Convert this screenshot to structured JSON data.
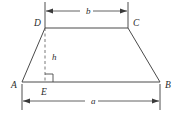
{
  "figure": {
    "name": "trapezoid-with-altitude",
    "colors": {
      "background": "#ffffff",
      "stroke": "#4a4a4a",
      "dimension_stroke": "#3a3a3a",
      "dashed_stroke": "#6a6a6a",
      "label_fill": "#2b2b2b"
    },
    "vertices": [
      {
        "id": "A",
        "label": "A",
        "x": 22,
        "y": 82,
        "label_x": 11,
        "label_y": 88
      },
      {
        "id": "B",
        "label": "B",
        "x": 160,
        "y": 82,
        "label_x": 165,
        "label_y": 88
      },
      {
        "id": "C",
        "label": "C",
        "x": 128,
        "y": 28,
        "label_x": 133,
        "label_y": 26
      },
      {
        "id": "D",
        "label": "D",
        "x": 45,
        "y": 28,
        "label_x": 34,
        "label_y": 26
      },
      {
        "id": "E",
        "label": "E",
        "x": 45,
        "y": 82,
        "label_x": 41,
        "label_y": 95
      }
    ],
    "altitude": {
      "label": "h",
      "label_x": 52,
      "label_y": 60,
      "from": "D",
      "to": "E",
      "style": "dashed",
      "right_angle_at": "E"
    },
    "dimensions": [
      {
        "id": "top",
        "label": "b",
        "label_x": 86,
        "label_y": 14,
        "measures": "DC",
        "line_y": 11,
        "from_x": 45,
        "to_x": 128,
        "ext_y1": 2,
        "ext_y2": 28,
        "position": "above"
      },
      {
        "id": "bottom",
        "label": "a",
        "label_x": 91,
        "label_y": 104,
        "measures": "AB",
        "line_y": 101,
        "from_x": 22,
        "to_x": 160,
        "ext_y1": 84,
        "ext_y2": 110,
        "position": "below"
      }
    ]
  }
}
